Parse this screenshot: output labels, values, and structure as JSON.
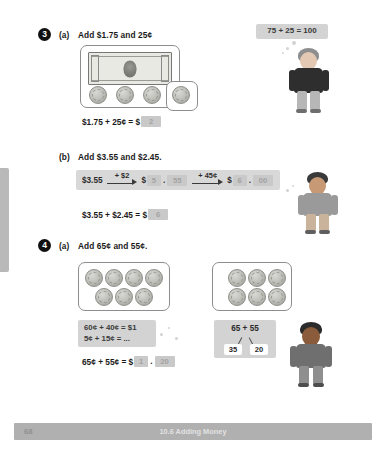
{
  "footer": {
    "page_number": "68",
    "section_title": "10.6 Adding Money"
  },
  "questions": [
    {
      "number": "3",
      "parts": [
        {
          "letter": "(a)",
          "prompt": "Add $1.75 and 25¢",
          "equation": {
            "lhs": "$1.75 + 25¢ = $",
            "answer": "2"
          },
          "hint": "75 + 25 = 100",
          "money": {
            "bill_label": "$1 bill",
            "grouped_coins": [
              "quarter",
              "quarter",
              "quarter"
            ],
            "extra_coins": [
              "quarter"
            ]
          }
        },
        {
          "letter": "(b)",
          "prompt": "Add $3.55 and $2.45.",
          "chain": {
            "start": "$3.55",
            "step1_label": "+ $2",
            "mid_dollars": "5",
            "mid_cents": "55",
            "step2_label": "+ 45¢",
            "end_dollars": "6",
            "end_cents": "00",
            "currency": "$",
            "separator": "."
          },
          "equation": {
            "lhs": "$3.55 + $2.45 = $",
            "answer": "6"
          }
        }
      ]
    },
    {
      "number": "4",
      "parts": [
        {
          "letter": "(a)",
          "prompt": "Add 65¢ and 55¢.",
          "coin_box_left": {
            "top_row": 4,
            "bottom_row": 3
          },
          "coin_box_right": {
            "top_row": 3,
            "bottom_row": 3
          },
          "hint_lines": [
            "60¢ + 40¢ = $1",
            "5¢ + 15¢ = ..."
          ],
          "number_bond": {
            "total": "65 + 55",
            "left": "35",
            "right": "20"
          },
          "equation": {
            "lhs": "65¢ + 55¢ = $",
            "answer_dollars": "1",
            "separator": ".",
            "answer_cents": "20"
          }
        }
      ]
    }
  ],
  "colors": {
    "blank_fill": "#c9c9c9",
    "hint_fill": "#d3d3d3",
    "strip_fill": "#d8d8d8",
    "footer_fill": "#b0b0b0",
    "coin_silver": "#c2c2bd"
  }
}
